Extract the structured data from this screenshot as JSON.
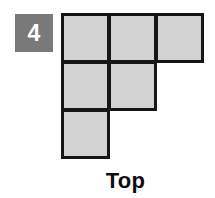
{
  "figure": {
    "index_badge": {
      "label": "4",
      "background_color": "#797979",
      "text_color": "#ffffff"
    },
    "caption": "Top",
    "caption_color": "#0d0d0d",
    "shape": {
      "kind": "polyomino",
      "cell_fill_color": "#d2d2d2",
      "cell_border_color": "#161616",
      "rows": 3,
      "columns": 3,
      "cell_count": 6,
      "occupied_cells": [
        {
          "row": 0,
          "col": 0
        },
        {
          "row": 0,
          "col": 1
        },
        {
          "row": 0,
          "col": 2
        },
        {
          "row": 1,
          "col": 0
        },
        {
          "row": 1,
          "col": 1
        },
        {
          "row": 2,
          "col": 0
        }
      ]
    }
  }
}
